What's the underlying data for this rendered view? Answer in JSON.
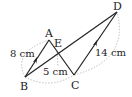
{
  "diagram": {
    "type": "geometry",
    "points": {
      "A": {
        "label": "A",
        "x": 49,
        "y": 40
      },
      "B": {
        "label": "B",
        "x": 25,
        "y": 77
      },
      "C": {
        "label": "C",
        "x": 74,
        "y": 75
      },
      "D": {
        "label": "D",
        "x": 117,
        "y": 12
      },
      "E": {
        "label": "E",
        "x": 57,
        "y": 50
      }
    },
    "segments": [
      "AB",
      "AC",
      "BD",
      "CD"
    ],
    "parallel_marks": [
      "AB",
      "CD"
    ],
    "measurements": {
      "AB": "8 cm",
      "E_to_BC": "5 cm",
      "CD": "14 cm"
    },
    "colors": {
      "line": "#222222",
      "dotted": "#aaaaaa"
    }
  }
}
